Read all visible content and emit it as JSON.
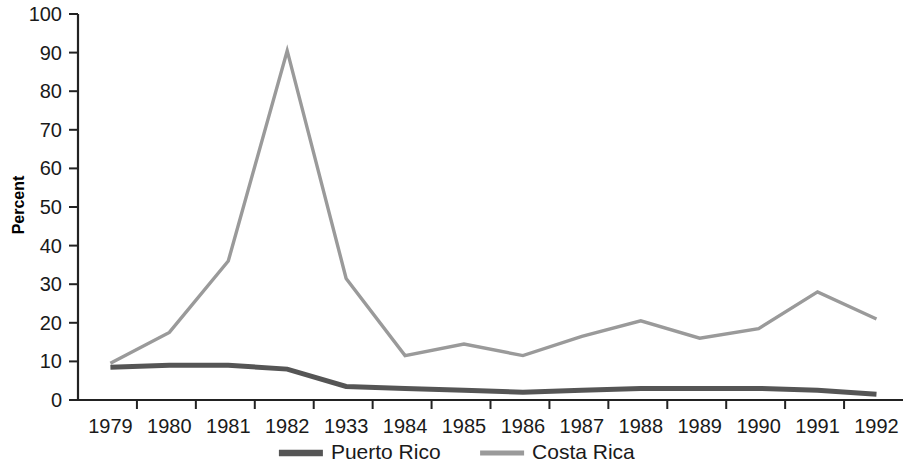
{
  "chart_data": {
    "type": "line",
    "title": "",
    "xlabel": "",
    "ylabel": "Percent",
    "ylim": [
      0,
      100
    ],
    "ytick_step": 10,
    "ytick_labels": [
      "0",
      "10",
      "20",
      "30",
      "40",
      "50",
      "60",
      "70",
      "80",
      "90",
      "100"
    ],
    "categories": [
      "1979",
      "1980",
      "1981",
      "1982",
      "1933",
      "1984",
      "1985",
      "1986",
      "1987",
      "1988",
      "1989",
      "1990",
      "1991",
      "1992"
    ],
    "grid": false,
    "legend_position": "bottom",
    "series": [
      {
        "name": "Puerto Rico",
        "color": "#555555",
        "values": [
          8.5,
          9,
          9,
          8,
          3.5,
          3,
          2.5,
          2,
          2.5,
          3,
          3,
          3,
          2.5,
          1.5
        ]
      },
      {
        "name": "Costa Rica",
        "color": "#9a9a9a",
        "values": [
          9.5,
          17.5,
          36,
          90.5,
          31.5,
          11.5,
          14.5,
          11.5,
          16.5,
          20.5,
          16,
          18.5,
          28,
          21
        ]
      }
    ]
  }
}
